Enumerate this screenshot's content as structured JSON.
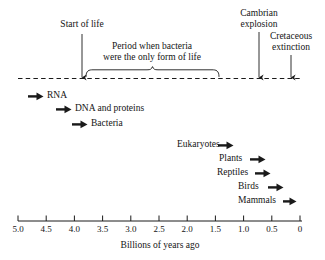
{
  "figure": {
    "axis_caption": "Billions of years ago",
    "axis_ticks": [
      "5.0",
      "4.5",
      "4.0",
      "3.5",
      "3.0",
      "2.5",
      "2.0",
      "1.5",
      "1.0",
      "0.5",
      "0"
    ],
    "axis_min": 0,
    "axis_max": 5.0,
    "line_color": "#1a1a1a"
  },
  "annotations": [
    {
      "label": "Start of life",
      "lines": [
        "Start of life"
      ],
      "time_bya": 3.85
    },
    {
      "label": "Period when bacteria were the only form of life",
      "lines": [
        "Period when bacteria",
        "were the only form of life"
      ],
      "bracket_from_bya": 3.8,
      "bracket_to_bya": 1.4
    },
    {
      "label": "Cambrian explosion",
      "lines": [
        "Cambrian",
        "explosion"
      ],
      "time_bya": 0.72
    },
    {
      "label": "Cretaceous extinction",
      "lines": [
        "Cretaceous",
        "extinction"
      ],
      "time_bya": 0.15
    }
  ],
  "events": [
    {
      "name": "RNA",
      "label": "RNA",
      "arrow_side": "left",
      "time_bya": 4.2
    },
    {
      "name": "DNA and proteins",
      "label": "DNA and proteins",
      "arrow_side": "left",
      "time_bya": 3.9
    },
    {
      "name": "Bacteria",
      "label": "Bacteria",
      "arrow_side": "left",
      "time_bya": 3.55
    },
    {
      "name": "Eukaryotes",
      "label": "Eukaryotes",
      "arrow_side": "right",
      "time_bya": 1.4
    },
    {
      "name": "Plants",
      "label": "Plants",
      "arrow_side": "right",
      "time_bya": 0.95
    },
    {
      "name": "Reptiles",
      "label": "Reptiles",
      "arrow_side": "right",
      "time_bya": 0.8
    },
    {
      "name": "Birds",
      "label": "Birds",
      "arrow_side": "right",
      "time_bya": 0.6
    },
    {
      "name": "Mammals",
      "label": "Mammals",
      "arrow_side": "right",
      "time_bya": 0.4
    }
  ],
  "chart_data": {
    "type": "timeline",
    "title": "",
    "xlabel": "Billions of years ago",
    "xlim": [
      5.0,
      0
    ],
    "x_ticks": [
      5.0,
      4.5,
      4.0,
      3.5,
      3.0,
      2.5,
      2.0,
      1.5,
      1.0,
      0.5,
      0
    ],
    "x_tick_labels": [
      "5.0",
      "4.5",
      "4.0",
      "3.5",
      "3.0",
      "2.5",
      "2.0",
      "1.5",
      "1.0",
      "0.5",
      "0"
    ],
    "axis_reversed": true,
    "grid": false,
    "legend": "none",
    "markers": [
      {
        "label": "Start of life",
        "x": 3.85,
        "kind": "down-arrow-to-dashed-line"
      },
      {
        "label": "Cambrian explosion",
        "x": 0.72,
        "kind": "down-arrow-to-dashed-line"
      },
      {
        "label": "Cretaceous extinction",
        "x": 0.15,
        "kind": "down-arrow-to-dashed-line"
      }
    ],
    "spans": [
      {
        "label": "Period when bacteria were the only form of life",
        "x_start": 3.8,
        "x_end": 1.4,
        "kind": "curly-brace"
      }
    ],
    "events": [
      {
        "label": "RNA",
        "x": 4.2,
        "arrow": "right-pointing",
        "label_side": "right-of-arrow"
      },
      {
        "label": "DNA and proteins",
        "x": 3.9,
        "arrow": "right-pointing",
        "label_side": "right-of-arrow"
      },
      {
        "label": "Bacteria",
        "x": 3.55,
        "arrow": "right-pointing",
        "label_side": "right-of-arrow"
      },
      {
        "label": "Eukaryotes",
        "x": 1.4,
        "arrow": "right-pointing",
        "label_side": "left-of-arrow"
      },
      {
        "label": "Plants",
        "x": 0.95,
        "arrow": "right-pointing",
        "label_side": "left-of-arrow"
      },
      {
        "label": "Reptiles",
        "x": 0.8,
        "arrow": "right-pointing",
        "label_side": "left-of-arrow"
      },
      {
        "label": "Birds",
        "x": 0.6,
        "arrow": "right-pointing",
        "label_side": "left-of-arrow"
      },
      {
        "label": "Mammals",
        "x": 0.4,
        "arrow": "right-pointing",
        "label_side": "left-of-arrow"
      }
    ]
  }
}
